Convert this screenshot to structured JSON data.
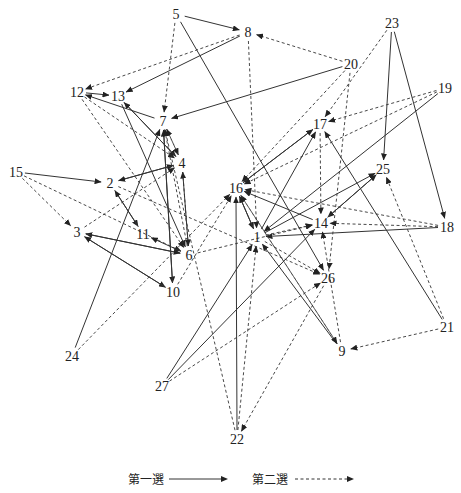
{
  "nodes": [
    {
      "id": "1",
      "x": 257,
      "y": 237
    },
    {
      "id": "2",
      "x": 110,
      "y": 183
    },
    {
      "id": "3",
      "x": 77,
      "y": 232
    },
    {
      "id": "4",
      "x": 182,
      "y": 163
    },
    {
      "id": "5",
      "x": 176,
      "y": 14
    },
    {
      "id": "6",
      "x": 189,
      "y": 255
    },
    {
      "id": "7",
      "x": 163,
      "y": 121
    },
    {
      "id": "8",
      "x": 248,
      "y": 32
    },
    {
      "id": "9",
      "x": 342,
      "y": 351
    },
    {
      "id": "10",
      "x": 173,
      "y": 292
    },
    {
      "id": "11",
      "x": 143,
      "y": 234
    },
    {
      "id": "12",
      "x": 77,
      "y": 92
    },
    {
      "id": "13",
      "x": 118,
      "y": 96
    },
    {
      "id": "14",
      "x": 321,
      "y": 223
    },
    {
      "id": "15",
      "x": 16,
      "y": 172
    },
    {
      "id": "16",
      "x": 236,
      "y": 188
    },
    {
      "id": "17",
      "x": 320,
      "y": 124
    },
    {
      "id": "18",
      "x": 447,
      "y": 227
    },
    {
      "id": "19",
      "x": 445,
      "y": 88
    },
    {
      "id": "20",
      "x": 351,
      "y": 64
    },
    {
      "id": "21",
      "x": 447,
      "y": 327
    },
    {
      "id": "22",
      "x": 237,
      "y": 439
    },
    {
      "id": "23",
      "x": 392,
      "y": 23
    },
    {
      "id": "24",
      "x": 72,
      "y": 356
    },
    {
      "id": "25",
      "x": 383,
      "y": 169
    },
    {
      "id": "26",
      "x": 328,
      "y": 278
    },
    {
      "id": "27",
      "x": 162,
      "y": 386
    }
  ],
  "edges": [
    {
      "from": "5",
      "to": "8",
      "type": "first"
    },
    {
      "from": "5",
      "to": "7",
      "type": "second"
    },
    {
      "from": "8",
      "to": "13",
      "type": "first"
    },
    {
      "from": "8",
      "to": "12",
      "type": "second"
    },
    {
      "from": "8",
      "to": "1",
      "type": "second"
    },
    {
      "from": "20",
      "to": "8",
      "type": "second"
    },
    {
      "from": "20",
      "to": "7",
      "type": "first"
    },
    {
      "from": "20",
      "to": "16",
      "type": "second"
    },
    {
      "from": "20",
      "to": "26",
      "type": "second"
    },
    {
      "from": "12",
      "to": "13",
      "type": "first"
    },
    {
      "from": "12",
      "to": "4",
      "type": "second"
    },
    {
      "from": "12",
      "to": "6",
      "type": "second"
    },
    {
      "from": "7",
      "to": "12",
      "type": "first"
    },
    {
      "from": "13",
      "to": "4",
      "type": "first"
    },
    {
      "from": "4",
      "to": "13",
      "type": "first"
    },
    {
      "from": "13",
      "to": "6",
      "type": "first"
    },
    {
      "from": "7",
      "to": "4",
      "type": "second"
    },
    {
      "from": "4",
      "to": "7",
      "type": "second"
    },
    {
      "from": "15",
      "to": "2",
      "type": "first"
    },
    {
      "from": "15",
      "to": "3",
      "type": "second"
    },
    {
      "from": "15",
      "to": "6",
      "type": "second"
    },
    {
      "from": "2",
      "to": "4",
      "type": "first"
    },
    {
      "from": "4",
      "to": "2",
      "type": "first"
    },
    {
      "from": "2",
      "to": "11",
      "type": "first"
    },
    {
      "from": "11",
      "to": "2",
      "type": "first"
    },
    {
      "from": "3",
      "to": "4",
      "type": "second"
    },
    {
      "from": "6",
      "to": "3",
      "type": "first"
    },
    {
      "from": "3",
      "to": "6",
      "type": "first"
    },
    {
      "from": "3",
      "to": "10",
      "type": "first"
    },
    {
      "from": "10",
      "to": "3",
      "type": "first"
    },
    {
      "from": "6",
      "to": "11",
      "type": "first"
    },
    {
      "from": "6",
      "to": "4",
      "type": "first"
    },
    {
      "from": "4",
      "to": "6",
      "type": "second"
    },
    {
      "from": "7",
      "to": "10",
      "type": "first"
    },
    {
      "from": "10",
      "to": "7",
      "type": "first"
    },
    {
      "from": "24",
      "to": "7",
      "type": "first"
    },
    {
      "from": "24",
      "to": "16",
      "type": "second"
    },
    {
      "from": "6",
      "to": "7",
      "type": "second"
    },
    {
      "from": "10",
      "to": "16",
      "type": "second"
    },
    {
      "from": "5",
      "to": "26",
      "type": "first"
    },
    {
      "from": "23",
      "to": "25",
      "type": "first"
    },
    {
      "from": "23",
      "to": "18",
      "type": "first"
    },
    {
      "from": "23",
      "to": "17",
      "type": "second"
    },
    {
      "from": "19",
      "to": "17",
      "type": "second"
    },
    {
      "from": "19",
      "to": "1",
      "type": "first"
    },
    {
      "from": "19",
      "to": "16",
      "type": "second"
    },
    {
      "from": "17",
      "to": "16",
      "type": "first"
    },
    {
      "from": "16",
      "to": "17",
      "type": "first"
    },
    {
      "from": "1",
      "to": "17",
      "type": "first"
    },
    {
      "from": "17",
      "to": "14",
      "type": "second"
    },
    {
      "from": "21",
      "to": "17",
      "type": "first"
    },
    {
      "from": "21",
      "to": "9",
      "type": "second"
    },
    {
      "from": "21",
      "to": "25",
      "type": "second"
    },
    {
      "from": "25",
      "to": "14",
      "type": "first"
    },
    {
      "from": "14",
      "to": "25",
      "type": "first"
    },
    {
      "from": "1",
      "to": "25",
      "type": "first"
    },
    {
      "from": "18",
      "to": "1",
      "type": "first"
    },
    {
      "from": "18",
      "to": "14",
      "type": "second"
    },
    {
      "from": "18",
      "to": "16",
      "type": "second"
    },
    {
      "from": "14",
      "to": "16",
      "type": "first"
    },
    {
      "from": "16",
      "to": "1",
      "type": "first"
    },
    {
      "from": "1",
      "to": "16",
      "type": "first"
    },
    {
      "from": "1",
      "to": "14",
      "type": "second"
    },
    {
      "from": "9",
      "to": "14",
      "type": "second"
    },
    {
      "from": "9",
      "to": "1",
      "type": "first"
    },
    {
      "from": "9",
      "to": "16",
      "type": "second"
    },
    {
      "from": "1",
      "to": "26",
      "type": "second"
    },
    {
      "from": "26",
      "to": "22",
      "type": "second"
    },
    {
      "from": "27",
      "to": "1",
      "type": "first"
    },
    {
      "from": "27",
      "to": "14",
      "type": "first"
    },
    {
      "from": "27",
      "to": "26",
      "type": "second"
    },
    {
      "from": "22",
      "to": "16",
      "type": "first"
    },
    {
      "from": "22",
      "to": "1",
      "type": "second"
    },
    {
      "from": "22",
      "to": "7",
      "type": "second"
    },
    {
      "from": "16",
      "to": "9",
      "type": "second"
    },
    {
      "from": "6",
      "to": "14",
      "type": "second"
    },
    {
      "from": "2",
      "to": "26",
      "type": "second"
    }
  ],
  "legend": {
    "first_choice_label": "第一選",
    "second_choice_label": "第二選"
  },
  "colors": {
    "edge": "#333333",
    "label": "#222222",
    "background": "#ffffff"
  }
}
